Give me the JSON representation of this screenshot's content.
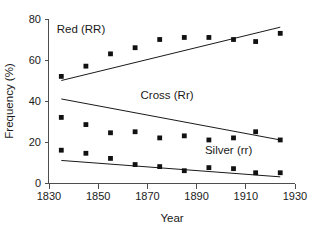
{
  "chart_data": {
    "type": "scatter",
    "title": "",
    "xlabel": "Year",
    "ylabel": "Frequency (%)",
    "xlim": [
      1830,
      1930
    ],
    "ylim": [
      0,
      80
    ],
    "xticks": [
      1830,
      1850,
      1870,
      1890,
      1910,
      1930
    ],
    "xtick_labels": [
      "1830",
      "1850",
      "1870",
      "1890",
      "1910",
      "1930"
    ],
    "yticks": [
      0,
      20,
      40,
      60,
      80
    ],
    "ytick_labels": [
      "0",
      "20",
      "40",
      "60",
      "80"
    ],
    "grid": false,
    "legend_position": "inline-annotations",
    "x": [
      1835,
      1845,
      1855,
      1865,
      1875,
      1885,
      1895,
      1905,
      1914,
      1924
    ],
    "series": [
      {
        "name": "Red (RR)",
        "label": "Red (RR)",
        "marker": "square",
        "values": [
          52,
          57,
          63,
          66,
          70,
          71,
          71,
          70,
          69,
          73
        ],
        "trend": {
          "x": [
            1835,
            1924
          ],
          "y": [
            50,
            76
          ]
        },
        "label_position": {
          "x": 1843,
          "y": 73
        }
      },
      {
        "name": "Cross (Rr)",
        "label": "Cross (Rr)",
        "marker": "square",
        "values": [
          32,
          28.5,
          24.5,
          25,
          22,
          23,
          21,
          22,
          25,
          21
        ],
        "trend": {
          "x": [
            1835,
            1924
          ],
          "y": [
            41,
            21
          ]
        },
        "label_position": {
          "x": 1878,
          "y": 41
        }
      },
      {
        "name": "Silver (rr)",
        "label": "Silver (rr)",
        "marker": "square",
        "values": [
          16,
          14.5,
          12,
          9,
          8,
          6,
          7.5,
          7,
          5,
          5
        ],
        "trend": {
          "x": [
            1835,
            1924
          ],
          "y": [
            11,
            3
          ]
        },
        "label_position": {
          "x": 1903,
          "y": 14
        }
      }
    ]
  },
  "axes": {
    "x_title": "Year",
    "y_title": "Frequency (%)"
  }
}
